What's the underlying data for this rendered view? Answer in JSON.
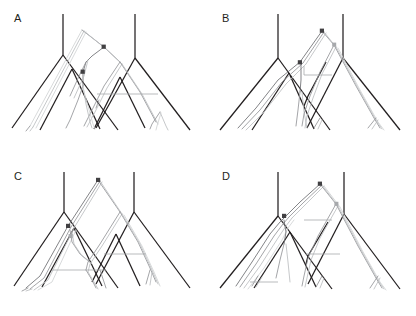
{
  "figure": {
    "background_color": "#ffffff",
    "width": 416,
    "height": 316,
    "kind": "phylogenetic-tree-reconciliation-figure",
    "panel_count": 4
  },
  "colors": {
    "species_tree": "#231f20",
    "gene_tree_dark": "#6d6e71",
    "gene_tree_mid": "#939598",
    "gene_tree_light": "#bcbec0",
    "gene_tree_pale": "#d1d3d4",
    "transfer_line": "#a7a9ac",
    "node_marker_dark": "#414042",
    "node_marker_mid": "#808285",
    "node_marker_light": "#a7a9ac"
  },
  "panels": [
    {
      "id": "A",
      "label": "A",
      "position": "top-left",
      "marked_nodes": 2,
      "horizontal_transfers": 1
    },
    {
      "id": "B",
      "label": "B",
      "position": "top-right",
      "marked_nodes": 3,
      "horizontal_transfers": 1
    },
    {
      "id": "C",
      "label": "C",
      "position": "bottom-left",
      "marked_nodes": 3,
      "horizontal_transfers": 2
    },
    {
      "id": "D",
      "label": "D",
      "position": "bottom-right",
      "marked_nodes": 2,
      "horizontal_transfers": 2
    }
  ]
}
